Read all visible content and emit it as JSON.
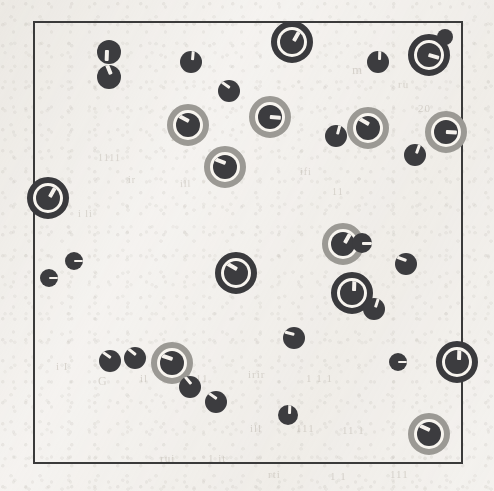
{
  "figure": {
    "title": "",
    "caption": "",
    "background_color": "#f4f2ef",
    "frame": {
      "x": 33,
      "y": 21,
      "width": 430,
      "height": 443,
      "border_color": "#3a3a3a",
      "border_width": 2
    },
    "marker_legend": {
      "plain": "plain-cell",
      "dark_ring": "dark-haloed-cell",
      "light_ring": "light-haloed-cell",
      "bud": "attached-bud"
    },
    "colors": {
      "cell_fill": "#3f3f42",
      "dark_ring": "#3d3d40",
      "light_ring": "#9a9893",
      "gap": "#f2efea",
      "wedge": "#efece7",
      "frame": "#3a3a3a",
      "paper": "#f4f2ef"
    },
    "counts": {
      "total": 44,
      "plain": 22,
      "dark_ring": 9,
      "light_ring": 11,
      "bud": 2
    }
  },
  "showthrough_text": [
    {
      "text": "m",
      "x": 352,
      "y": 62,
      "size": 13,
      "rot": -1
    },
    {
      "text": "ru",
      "x": 398,
      "y": 78,
      "size": 11,
      "rot": 2
    },
    {
      "text": "20",
      "x": 418,
      "y": 102,
      "size": 11,
      "rot": 0
    },
    {
      "text": "1111",
      "x": 98,
      "y": 152,
      "size": 10,
      "rot": 1
    },
    {
      "text": "1",
      "x": 170,
      "y": 132,
      "size": 10,
      "rot": 0
    },
    {
      "text": "ill",
      "x": 180,
      "y": 178,
      "size": 10,
      "rot": -2
    },
    {
      "text": "ir",
      "x": 128,
      "y": 174,
      "size": 10,
      "rot": 0
    },
    {
      "text": "lr",
      "x": 56,
      "y": 186,
      "size": 10,
      "rot": 1
    },
    {
      "text": "i li",
      "x": 78,
      "y": 208,
      "size": 10,
      "rot": 0
    },
    {
      "text": "ifi",
      "x": 300,
      "y": 166,
      "size": 10,
      "rot": 1
    },
    {
      "text": "11",
      "x": 332,
      "y": 186,
      "size": 10,
      "rot": 0
    },
    {
      "text": "i I",
      "x": 56,
      "y": 360,
      "size": 11,
      "rot": 0
    },
    {
      "text": "G",
      "x": 98,
      "y": 374,
      "size": 12,
      "rot": 0
    },
    {
      "text": "il",
      "x": 140,
      "y": 372,
      "size": 11,
      "rot": 0
    },
    {
      "text": "i 11",
      "x": 188,
      "y": 372,
      "size": 11,
      "rot": 1
    },
    {
      "text": "irir",
      "x": 248,
      "y": 368,
      "size": 11,
      "rot": 0
    },
    {
      "text": "1 1  1",
      "x": 306,
      "y": 372,
      "size": 11,
      "rot": 0
    },
    {
      "text": "ill",
      "x": 250,
      "y": 422,
      "size": 11,
      "rot": 0
    },
    {
      "text": "111",
      "x": 296,
      "y": 422,
      "size": 11,
      "rot": 0
    },
    {
      "text": "11 1",
      "x": 342,
      "y": 424,
      "size": 11,
      "rot": 0
    },
    {
      "text": "rui",
      "x": 160,
      "y": 452,
      "size": 11,
      "rot": 0
    },
    {
      "text": "1 it",
      "x": 208,
      "y": 452,
      "size": 11,
      "rot": 0
    },
    {
      "text": "rti",
      "x": 268,
      "y": 468,
      "size": 11,
      "rot": 0
    },
    {
      "text": "1 1",
      "x": 330,
      "y": 470,
      "size": 11,
      "rot": 0
    },
    {
      "text": "111",
      "x": 390,
      "y": 468,
      "size": 11,
      "rot": 0
    }
  ],
  "markers": [
    {
      "id": "m01",
      "type": "plain",
      "cx": 109,
      "cy": 52,
      "r": 12,
      "angle": 92
    },
    {
      "id": "m02",
      "type": "plain",
      "cx": 109,
      "cy": 77,
      "r": 12,
      "angle": 248
    },
    {
      "id": "m03",
      "type": "plain",
      "cx": 191,
      "cy": 62,
      "r": 11,
      "angle": 275
    },
    {
      "id": "m04",
      "type": "plain",
      "cx": 229,
      "cy": 91,
      "r": 11,
      "angle": 215
    },
    {
      "id": "m05",
      "type": "dark_ring",
      "cx": 292,
      "cy": 42,
      "r": 12,
      "ring": 21,
      "angle": 300
    },
    {
      "id": "m06",
      "type": "plain",
      "cx": 378,
      "cy": 62,
      "r": 11,
      "angle": 272
    },
    {
      "id": "m07",
      "type": "dark_ring",
      "cx": 429,
      "cy": 55,
      "r": 12,
      "ring": 21,
      "angle": 16
    },
    {
      "id": "m08",
      "type": "bud",
      "cx": 445,
      "cy": 37,
      "r": 8
    },
    {
      "id": "m09",
      "type": "light_ring",
      "cx": 188,
      "cy": 125,
      "r": 12,
      "ring": 21,
      "angle": 208
    },
    {
      "id": "m10",
      "type": "light_ring",
      "cx": 270,
      "cy": 117,
      "r": 12,
      "ring": 21,
      "angle": 5
    },
    {
      "id": "m11",
      "type": "plain",
      "cx": 336,
      "cy": 136,
      "r": 11,
      "angle": 285
    },
    {
      "id": "m12",
      "type": "light_ring",
      "cx": 368,
      "cy": 128,
      "r": 12,
      "ring": 21,
      "angle": 210
    },
    {
      "id": "m13",
      "type": "light_ring",
      "cx": 446,
      "cy": 132,
      "r": 12,
      "ring": 21,
      "angle": 3
    },
    {
      "id": "m14",
      "type": "plain",
      "cx": 415,
      "cy": 155,
      "r": 11,
      "angle": 290
    },
    {
      "id": "m15",
      "type": "light_ring",
      "cx": 225,
      "cy": 167,
      "r": 12,
      "ring": 21,
      "angle": 200
    },
    {
      "id": "m16",
      "type": "dark_ring",
      "cx": 48,
      "cy": 198,
      "r": 12,
      "ring": 21,
      "angle": 300
    },
    {
      "id": "m17",
      "type": "plain",
      "cx": 74,
      "cy": 261,
      "r": 9,
      "angle": 0
    },
    {
      "id": "m18",
      "type": "plain",
      "cx": 49,
      "cy": 278,
      "r": 9,
      "angle": 0
    },
    {
      "id": "m19",
      "type": "light_ring",
      "cx": 343,
      "cy": 244,
      "r": 12,
      "ring": 21,
      "angle": 300
    },
    {
      "id": "m20",
      "type": "plain",
      "cx": 362,
      "cy": 243,
      "r": 10,
      "angle": 0
    },
    {
      "id": "m21",
      "type": "plain",
      "cx": 406,
      "cy": 264,
      "r": 11,
      "angle": 200
    },
    {
      "id": "m22",
      "type": "dark_ring",
      "cx": 236,
      "cy": 273,
      "r": 12,
      "ring": 21,
      "angle": 210
    },
    {
      "id": "m23",
      "type": "dark_ring",
      "cx": 352,
      "cy": 293,
      "r": 12,
      "ring": 21,
      "angle": 272
    },
    {
      "id": "m24",
      "type": "plain",
      "cx": 374,
      "cy": 309,
      "r": 11,
      "angle": 288
    },
    {
      "id": "m25",
      "type": "plain",
      "cx": 294,
      "cy": 338,
      "r": 11,
      "angle": 195
    },
    {
      "id": "m26",
      "type": "plain",
      "cx": 398,
      "cy": 362,
      "r": 9,
      "angle": 0
    },
    {
      "id": "m27",
      "type": "dark_ring",
      "cx": 457,
      "cy": 362,
      "r": 12,
      "ring": 21,
      "angle": 272
    },
    {
      "id": "m28",
      "type": "plain",
      "cx": 110,
      "cy": 361,
      "r": 11,
      "angle": 215
    },
    {
      "id": "m29",
      "type": "plain",
      "cx": 135,
      "cy": 358,
      "r": 11,
      "angle": 218
    },
    {
      "id": "m30",
      "type": "light_ring",
      "cx": 172,
      "cy": 363,
      "r": 12,
      "ring": 21,
      "angle": 198
    },
    {
      "id": "m31",
      "type": "plain",
      "cx": 190,
      "cy": 387,
      "r": 11,
      "angle": 230
    },
    {
      "id": "m32",
      "type": "plain",
      "cx": 216,
      "cy": 402,
      "r": 11,
      "angle": 215
    },
    {
      "id": "m33",
      "type": "plain",
      "cx": 288,
      "cy": 415,
      "r": 10,
      "angle": 272
    },
    {
      "id": "m34",
      "type": "light_ring",
      "cx": 429,
      "cy": 434,
      "r": 12,
      "ring": 21,
      "angle": 205
    }
  ]
}
